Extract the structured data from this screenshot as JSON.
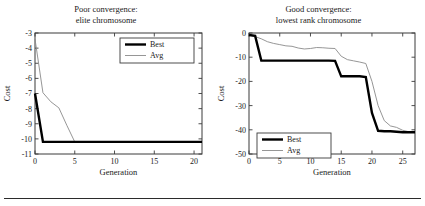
{
  "figure": {
    "bottom_rule": true,
    "background": "#ffffff"
  },
  "chart_data": [
    {
      "type": "line",
      "panel": "left",
      "title": "Poor convergence:",
      "subtitle": "elite chromosome",
      "xlabel": "Generation",
      "ylabel": "Cost",
      "xlim": [
        0,
        21
      ],
      "ylim": [
        -11,
        -3
      ],
      "xticks": [
        0,
        5,
        10,
        15,
        20
      ],
      "xticklabels": [
        "0",
        "5",
        "10",
        "15",
        "20"
      ],
      "yticks": [
        -3,
        -4,
        -5,
        -6,
        -7,
        -8,
        -9,
        -10,
        -11
      ],
      "yticklabels": [
        "-3",
        "-4",
        "-5",
        "-6",
        "-7",
        "-8",
        "-9",
        "-10",
        "-11"
      ],
      "grid": false,
      "legend_position": "top-right",
      "series": [
        {
          "name": "Best",
          "color": "#000000",
          "width": 2.4,
          "x": [
            0,
            1,
            2,
            3,
            4,
            5,
            6,
            8,
            10,
            12,
            14,
            16,
            18,
            20,
            21
          ],
          "values": [
            -7.0,
            -10.2,
            -10.2,
            -10.2,
            -10.2,
            -10.2,
            -10.2,
            -10.2,
            -10.2,
            -10.2,
            -10.2,
            -10.2,
            -10.2,
            -10.2,
            -10.2
          ]
        },
        {
          "name": "Avg",
          "color": "#8a8a8a",
          "width": 0.9,
          "x": [
            0,
            1,
            2,
            3,
            4,
            5,
            6,
            8,
            10,
            12,
            14,
            16,
            18,
            20,
            21
          ],
          "values": [
            -3.4,
            -6.95,
            -7.55,
            -7.95,
            -9.1,
            -10.2,
            -10.2,
            -10.2,
            -10.2,
            -10.2,
            -10.2,
            -10.2,
            -10.2,
            -10.2,
            -10.2
          ]
        }
      ]
    },
    {
      "type": "line",
      "panel": "right",
      "title": "Good convergence:",
      "subtitle": "lowest rank chromosome",
      "xlabel": "Generation",
      "ylabel": "Cost",
      "xlim": [
        0,
        27
      ],
      "ylim": [
        -50,
        0
      ],
      "xticks": [
        0,
        5,
        10,
        15,
        20,
        25
      ],
      "xticklabels": [
        "0",
        "5",
        "10",
        "15",
        "20",
        "25"
      ],
      "yticks": [
        0,
        -10,
        -20,
        -30,
        -40,
        -50
      ],
      "yticklabels": [
        "0",
        "-10",
        "-20",
        "-30",
        "-40",
        "-50"
      ],
      "grid": false,
      "legend_position": "bottom-left",
      "series": [
        {
          "name": "Best",
          "color": "#000000",
          "width": 2.4,
          "x": [
            0,
            1,
            2,
            3,
            5,
            8,
            10,
            12,
            13,
            14,
            15,
            16,
            17,
            18,
            19,
            20,
            21,
            22,
            23,
            24,
            25,
            26,
            27
          ],
          "values": [
            -0.8,
            -1.2,
            -11.4,
            -11.4,
            -11.4,
            -11.4,
            -11.4,
            -11.4,
            -11.4,
            -11.5,
            -17.9,
            -17.9,
            -17.9,
            -17.9,
            -18.2,
            -33.0,
            -40.4,
            -40.6,
            -40.6,
            -40.8,
            -41.0,
            -41.0,
            -41.0
          ]
        },
        {
          "name": "Avg",
          "color": "#8a8a8a",
          "width": 0.9,
          "x": [
            0,
            1,
            2,
            3,
            4,
            5,
            6,
            7,
            8,
            9,
            10,
            11,
            12,
            13,
            14,
            15,
            16,
            17,
            18,
            19,
            20,
            21,
            22,
            23,
            24,
            25,
            26,
            27
          ],
          "values": [
            -0.8,
            -1.5,
            -2.4,
            -3.6,
            -4.3,
            -4.8,
            -5.3,
            -5.5,
            -6.2,
            -6.6,
            -6.4,
            -6.0,
            -6.1,
            -6.3,
            -6.4,
            -9.6,
            -11.0,
            -11.5,
            -12.0,
            -12.6,
            -20.0,
            -30.0,
            -36.2,
            -38.4,
            -39.0,
            -40.2,
            -40.8,
            -41.0
          ]
        }
      ]
    }
  ]
}
